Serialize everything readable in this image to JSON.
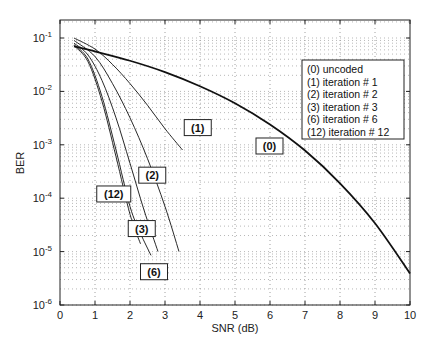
{
  "chart_data": {
    "type": "line",
    "title": "",
    "xlabel": "SNR (dB)",
    "ylabel": "BER",
    "xlim": [
      0,
      10
    ],
    "ylim": [
      1e-06,
      0.2
    ],
    "yscale": "log",
    "grid": "dotted",
    "x_ticks": [
      "0",
      "1",
      "2",
      "3",
      "4",
      "5",
      "6",
      "7",
      "8",
      "9",
      "10"
    ],
    "y_ticks": [
      {
        "base": "10",
        "exp": "-1",
        "value": 0.1
      },
      {
        "base": "10",
        "exp": "-2",
        "value": 0.01
      },
      {
        "base": "10",
        "exp": "-3",
        "value": 0.001
      },
      {
        "base": "10",
        "exp": "-4",
        "value": 0.0001
      },
      {
        "base": "10",
        "exp": "-5",
        "value": 1e-05
      },
      {
        "base": "10",
        "exp": "-6",
        "value": 1e-06
      }
    ],
    "legend": {
      "position": "upper right (inside)",
      "entries": [
        "(0) uncoded",
        "(1) iteration # 1",
        "(2) iteration # 2",
        "(3) iteration # 3",
        "(6) iteration # 6",
        "(12) iteration # 12"
      ]
    },
    "series": [
      {
        "name": "(0) uncoded",
        "tag": "(0)",
        "width": 2,
        "x": [
          0.4,
          1,
          2,
          3,
          4,
          5,
          6,
          7,
          8,
          9,
          10
        ],
        "y": [
          0.07,
          0.056,
          0.0375,
          0.023,
          0.0125,
          0.006,
          0.0024,
          0.00078,
          0.00019,
          3.4e-05,
          3.9e-06
        ],
        "label_pos": [
          5.6,
          0.00095
        ]
      },
      {
        "name": "(1) iteration # 1",
        "tag": "(1)",
        "width": 1,
        "x": [
          0.4,
          1,
          1.5,
          2,
          2.5,
          3,
          3.5
        ],
        "y": [
          0.1,
          0.062,
          0.032,
          0.014,
          0.0055,
          0.002,
          0.0008
        ],
        "label_pos": [
          3.55,
          0.0021
        ]
      },
      {
        "name": "(2) iteration # 2",
        "tag": "(2)",
        "width": 1,
        "x": [
          0.4,
          1,
          1.5,
          2,
          2.5,
          3,
          3.4
        ],
        "y": [
          0.09,
          0.045,
          0.014,
          0.0032,
          0.00055,
          7e-05,
          1e-05
        ],
        "label_pos": [
          2.25,
          0.00027
        ]
      },
      {
        "name": "(3) iteration # 3",
        "tag": "(3)",
        "width": 1,
        "x": [
          0.4,
          0.8,
          1.2,
          1.6,
          2,
          2.4,
          2.8
        ],
        "y": [
          0.08,
          0.048,
          0.016,
          0.0032,
          0.00045,
          6e-05,
          1e-05
        ],
        "label_pos": [
          1.95,
          2.7e-05
        ]
      },
      {
        "name": "(6) iteration # 6",
        "tag": "(6)",
        "width": 1,
        "x": [
          0.4,
          0.8,
          1.2,
          1.6,
          2,
          2.3,
          2.6
        ],
        "y": [
          0.075,
          0.04,
          0.008,
          0.0008,
          7e-05,
          2.2e-05,
          8.5e-06
        ],
        "label_pos": [
          2.3,
          4.2e-06
        ]
      },
      {
        "name": "(12) iteration # 12",
        "tag": "(12)",
        "width": 1,
        "x": [
          0.4,
          0.8,
          1.2,
          1.6,
          2,
          2.3
        ],
        "y": [
          0.072,
          0.036,
          0.0065,
          0.0006,
          5e-05,
          1.4e-05
        ],
        "label_pos": [
          1.05,
          0.00012
        ]
      }
    ]
  }
}
